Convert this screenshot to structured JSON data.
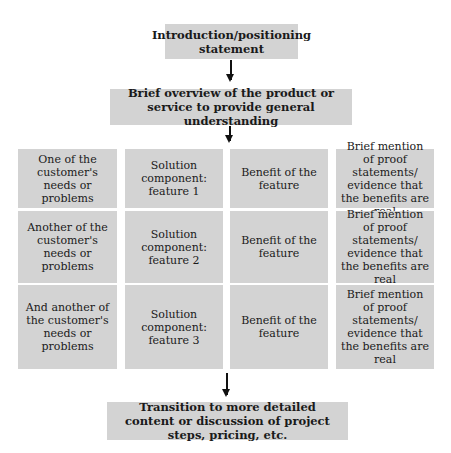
{
  "flow": {
    "intro": "Introduction/positioning statement",
    "overview": "Brief overview of the product or service to provide general understanding",
    "transition": "Transition to more detailed content or discussion of project steps, pricing, etc."
  },
  "grid": {
    "rows": [
      {
        "need": "One of the customer's needs or problems",
        "solution": "Solution component: feature 1",
        "benefit": "Benefit of the feature",
        "proof": "Brief mention of proof statements/ evidence that the benefits are real"
      },
      {
        "need": "Another of the customer's needs or problems",
        "solution": "Solution component: feature 2",
        "benefit": "Benefit of the feature",
        "proof": "Brief mention of proof statements/ evidence that the benefits are real"
      },
      {
        "need": "And another of the customer's needs or problems",
        "solution": "Solution component: feature 3",
        "benefit": "Benefit of the feature",
        "proof": "Brief mention of proof statements/ evidence that the benefits are real"
      }
    ]
  },
  "colors": {
    "box_fill": "#d3d3d3",
    "arrow": "#111111",
    "background": "#ffffff"
  }
}
